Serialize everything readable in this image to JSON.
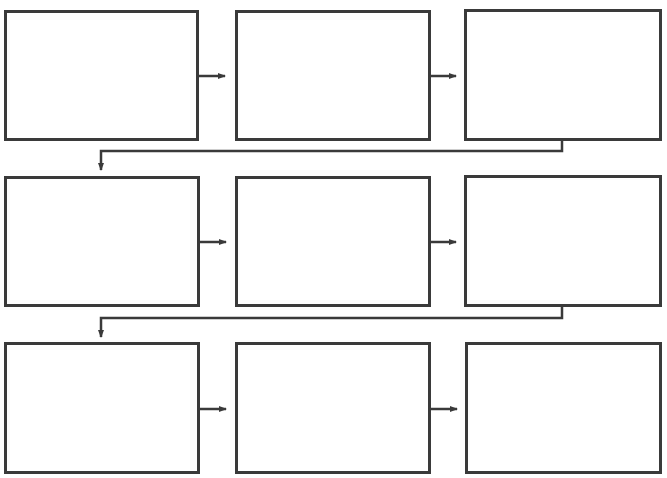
{
  "diagram": {
    "title": "",
    "type": "flowchart",
    "layout": "3x3 serpentine grid (left-to-right, wrapping to next row)",
    "colors": {
      "stroke": "#3a3a3a",
      "background": "#ffffff",
      "box_fill": "#ffffff"
    },
    "boxes": [
      {
        "id": "step-1",
        "label": "",
        "row": 1,
        "col": 1
      },
      {
        "id": "step-2",
        "label": "",
        "row": 1,
        "col": 2
      },
      {
        "id": "step-3",
        "label": "",
        "row": 1,
        "col": 3
      },
      {
        "id": "step-4",
        "label": "",
        "row": 2,
        "col": 1
      },
      {
        "id": "step-5",
        "label": "",
        "row": 2,
        "col": 2
      },
      {
        "id": "step-6",
        "label": "",
        "row": 2,
        "col": 3
      },
      {
        "id": "step-7",
        "label": "",
        "row": 3,
        "col": 1
      },
      {
        "id": "step-8",
        "label": "",
        "row": 3,
        "col": 2
      },
      {
        "id": "step-9",
        "label": "",
        "row": 3,
        "col": 3
      }
    ],
    "edges": [
      {
        "from": "step-1",
        "to": "step-2",
        "type": "right-arrow"
      },
      {
        "from": "step-2",
        "to": "step-3",
        "type": "right-arrow"
      },
      {
        "from": "step-3",
        "to": "step-4",
        "type": "elbow-wrap-arrow"
      },
      {
        "from": "step-4",
        "to": "step-5",
        "type": "right-arrow"
      },
      {
        "from": "step-5",
        "to": "step-6",
        "type": "right-arrow"
      },
      {
        "from": "step-6",
        "to": "step-7",
        "type": "elbow-wrap-arrow"
      },
      {
        "from": "step-7",
        "to": "step-8",
        "type": "right-arrow"
      },
      {
        "from": "step-8",
        "to": "step-9",
        "type": "right-arrow"
      }
    ]
  }
}
